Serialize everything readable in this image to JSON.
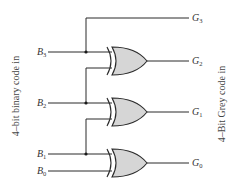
{
  "diagram": {
    "left_label": "4–bit binary code in",
    "right_label": "4–Bit Grey code in",
    "inputs": [
      {
        "name": "B",
        "sub": "3"
      },
      {
        "name": "B",
        "sub": "2"
      },
      {
        "name": "B",
        "sub": "1"
      },
      {
        "name": "B",
        "sub": "0"
      }
    ],
    "outputs": [
      {
        "name": "G",
        "sub": "3"
      },
      {
        "name": "G",
        "sub": "2"
      },
      {
        "name": "G",
        "sub": "1"
      },
      {
        "name": "G",
        "sub": "0"
      }
    ],
    "gates": [
      {
        "type": "XOR",
        "inputs": [
          "B3",
          "B2"
        ],
        "output": "G2"
      },
      {
        "type": "XOR",
        "inputs": [
          "B2",
          "B1"
        ],
        "output": "G1"
      },
      {
        "type": "XOR",
        "inputs": [
          "B1",
          "B0"
        ],
        "output": "G0"
      }
    ],
    "direct_connections": [
      {
        "from": "B3",
        "to": "G3"
      }
    ],
    "colors": {
      "gate_fill": "#d6d6d6",
      "wire": "#2a2a2a",
      "background": "#ffffff"
    }
  }
}
